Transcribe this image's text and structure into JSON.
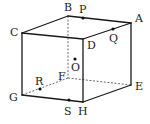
{
  "diagram": {
    "type": "cube",
    "vertices": {
      "A": {
        "x": 131,
        "y": 23,
        "label": "A",
        "lx": 135,
        "ly": 22
      },
      "B": {
        "x": 68,
        "y": 16,
        "label": "B",
        "lx": 64,
        "ly": 11
      },
      "C": {
        "x": 22,
        "y": 33,
        "label": "C",
        "lx": 10,
        "ly": 36
      },
      "D": {
        "x": 83,
        "y": 39,
        "label": "D",
        "lx": 87,
        "ly": 49
      },
      "E": {
        "x": 131,
        "y": 85,
        "label": "E",
        "lx": 135,
        "ly": 90
      },
      "F": {
        "x": 68,
        "y": 78,
        "label": "F",
        "lx": 58,
        "ly": 80
      },
      "G": {
        "x": 22,
        "y": 95,
        "label": "G",
        "lx": 9,
        "ly": 101
      },
      "H": {
        "x": 83,
        "y": 102,
        "label": "H",
        "lx": 78,
        "ly": 115
      }
    },
    "points": {
      "P": {
        "x": 83,
        "y": 18,
        "label": "P",
        "lx": 79,
        "ly": 13
      },
      "Q": {
        "x": 113,
        "y": 29,
        "label": "Q",
        "lx": 109,
        "ly": 42
      },
      "O": {
        "x": 75,
        "y": 59,
        "label": "O",
        "lx": 71,
        "ly": 71
      },
      "R": {
        "x": 40,
        "y": 89,
        "label": "R",
        "lx": 35,
        "ly": 85
      },
      "S": {
        "x": 69,
        "y": 100,
        "label": "S",
        "lx": 64,
        "ly": 115
      }
    },
    "visible_edges": [
      [
        "B",
        "A"
      ],
      [
        "C",
        "B"
      ],
      [
        "C",
        "D"
      ],
      [
        "D",
        "A"
      ],
      [
        "C",
        "G"
      ],
      [
        "D",
        "H"
      ],
      [
        "A",
        "E"
      ],
      [
        "G",
        "H"
      ],
      [
        "H",
        "E"
      ]
    ],
    "hidden_edges": [
      [
        "B",
        "F"
      ],
      [
        "F",
        "G"
      ],
      [
        "F",
        "E"
      ]
    ],
    "colors": {
      "line": "#1a1a1a",
      "dashed": "#444444",
      "background": "#ffffff"
    }
  }
}
